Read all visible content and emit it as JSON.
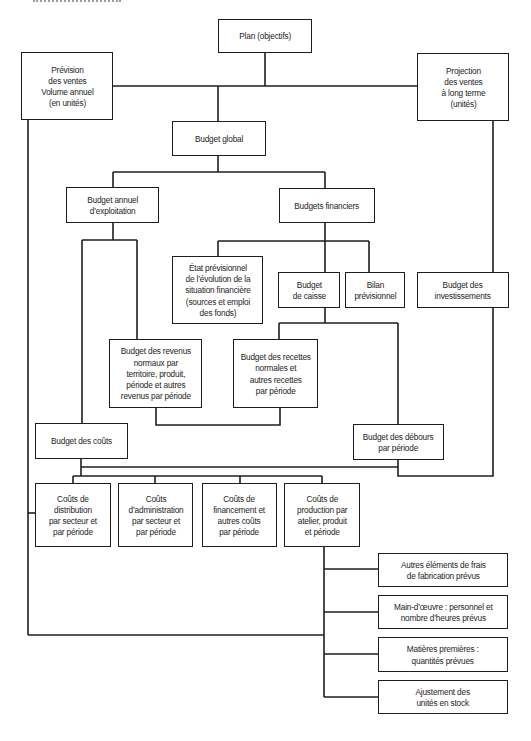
{
  "diagram": {
    "type": "flowchart",
    "language": "fr",
    "line_color": "#1e1e1e",
    "nodes": {
      "plan": "Plan (objectifs)",
      "prevision_ventes": "Prévision\ndes ventes\nVolume annuel\n(en unités)",
      "projection_ventes": "Projection\ndes ventes\nà long terme\n(unités)",
      "budget_global": "Budget global",
      "budget_annuel": "Budget annuel\nd’exploitation",
      "budgets_financiers": "Budgets financiers",
      "etat_previsionnel": "État prévisionnel\nde l’évolution de la\nsituation financière\n(sources et emploi\ndes fonds)",
      "budget_caisse": "Budget\nde caisse",
      "bilan_previsionnel": "Bilan\nprévisionnel",
      "budget_investissements": "Budget des\ninvestissements",
      "budget_revenus": "Budget des revenus\nnormaux par\nterritoire, produit,\npériode et autres\nrevenus par période",
      "budget_recettes": "Budget des recettes\nnormales et\nautres recettes\npar période",
      "budget_couts": "Budget des coûts",
      "budget_debours": "Budget des débours\npar période",
      "couts_distribution": "Coûts de\ndistribution\npar secteur et\npar période",
      "couts_administration": "Coûts\nd’administration\npar secteur et\npar période",
      "couts_financement": "Coûts de\nfinancement et\nautres coûts\npar période",
      "couts_production": "Coûts de\nproduction par\natelier, produit\net période",
      "autres_frais": "Autres éléments de frais\nde fabrication prévus",
      "main_oeuvre": "Main-d’œuvre : personnel et\nnombre d’heures prévus",
      "matieres_premieres": "Matières premières :\nquantités prévues",
      "ajustement_stock": "Ajustement des\nunités en stock"
    },
    "edges": [
      [
        "plan",
        "budget_global"
      ],
      [
        "plan",
        "prevision_ventes"
      ],
      [
        "plan",
        "projection_ventes"
      ],
      [
        "budget_global",
        "budget_annuel"
      ],
      [
        "budget_global",
        "budgets_financiers"
      ],
      [
        "budgets_financiers",
        "etat_previsionnel"
      ],
      [
        "budgets_financiers",
        "budget_caisse"
      ],
      [
        "budgets_financiers",
        "bilan_previsionnel"
      ],
      [
        "projection_ventes",
        "budget_investissements"
      ],
      [
        "budget_annuel",
        "budget_couts"
      ],
      [
        "budget_annuel",
        "budget_revenus"
      ],
      [
        "budget_caisse",
        "budget_recettes"
      ],
      [
        "budget_caisse",
        "budget_debours"
      ],
      [
        "budget_revenus",
        "budget_recettes"
      ],
      [
        "budget_couts",
        "budget_debours"
      ],
      [
        "budget_investissements",
        "budget_debours"
      ],
      [
        "budget_couts",
        "couts_distribution"
      ],
      [
        "budget_couts",
        "couts_administration"
      ],
      [
        "budget_couts",
        "couts_financement"
      ],
      [
        "budget_couts",
        "couts_production"
      ],
      [
        "couts_production",
        "autres_frais"
      ],
      [
        "couts_production",
        "main_oeuvre"
      ],
      [
        "couts_production",
        "matieres_premieres"
      ],
      [
        "couts_production",
        "ajustement_stock"
      ],
      [
        "prevision_ventes",
        "couts_distribution"
      ],
      [
        "prevision_ventes",
        "couts_production"
      ]
    ]
  }
}
